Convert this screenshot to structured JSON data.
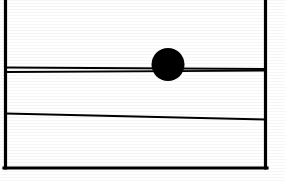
{
  "figure": {
    "background_color": "#ffffff",
    "ink_color": "#000000",
    "canvas": {
      "width": 285,
      "height": 181
    },
    "elements": {
      "frame": {
        "name": "rectangular-frame",
        "left_x": 5.5,
        "right_x": 265.5,
        "top_y": -2,
        "bottom_y": 168,
        "stroke_width": 3.2,
        "top_edge_visible": false
      },
      "rail_upper_line": {
        "name": "upper-rail-line",
        "x1": 5.5,
        "y1": 67.5,
        "x2": 265.5,
        "y2": 69.0,
        "stroke_width": 1.9
      },
      "rail_lower_line": {
        "name": "lower-rail-line",
        "x1": 5.5,
        "y1": 72.0,
        "x2": 265.5,
        "y2": 70.6,
        "stroke_width": 1.9
      },
      "ball": {
        "name": "filled-circle-ball",
        "center_x": 168,
        "center_y": 64.5,
        "radius": 16.5,
        "fill": "#000000"
      },
      "sloped_line": {
        "name": "sloped-line",
        "x1": 5.5,
        "y1": 113.5,
        "x2": 265.5,
        "y2": 119.5,
        "stroke_width": 2.0
      }
    }
  }
}
